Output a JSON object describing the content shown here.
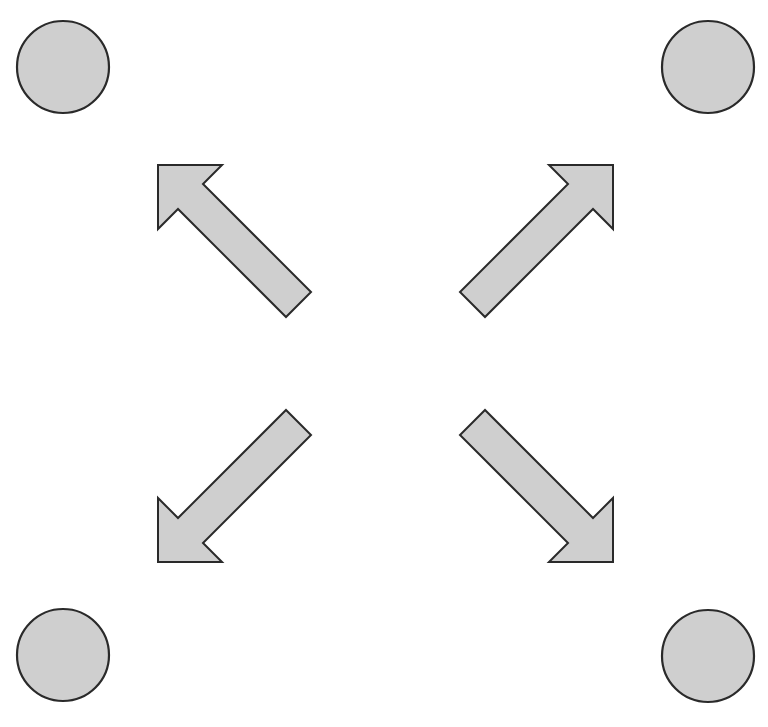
{
  "diagram": {
    "type": "expand-outward",
    "colors": {
      "fill": "#cfcfcf",
      "stroke": "#2a2a2a",
      "background": "#ffffff"
    },
    "circles": [
      {
        "id": "top-left",
        "cx": 63,
        "cy": 67,
        "r": 47
      },
      {
        "id": "top-right",
        "cx": 708,
        "cy": 67,
        "r": 47
      },
      {
        "id": "bottom-left",
        "cx": 63,
        "cy": 655,
        "r": 47
      },
      {
        "id": "bottom-right",
        "cx": 708,
        "cy": 656,
        "r": 47
      }
    ],
    "arrows": [
      {
        "id": "arrow-up-left",
        "direction": "north-west"
      },
      {
        "id": "arrow-up-right",
        "direction": "north-east"
      },
      {
        "id": "arrow-down-left",
        "direction": "south-west"
      },
      {
        "id": "arrow-down-right",
        "direction": "south-east"
      }
    ]
  }
}
